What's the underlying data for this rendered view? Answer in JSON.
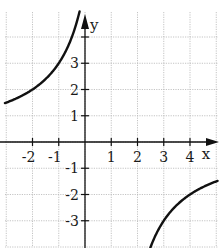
{
  "chart_data": {
    "type": "line",
    "title": "",
    "xlabel": "x",
    "ylabel": "y",
    "function": "y = -6/(x - 1)",
    "vertical_asymptote": 1,
    "horizontal_asymptote": 0,
    "xlim": [
      -3.2,
      5.0
    ],
    "ylim": [
      -3.9,
      5.0
    ],
    "grid": true,
    "x_ticks": [
      -2,
      -1,
      1,
      2,
      3,
      4
    ],
    "y_ticks": [
      -3,
      -2,
      -1,
      1,
      2,
      3
    ],
    "series": [
      {
        "name": "left branch",
        "points": [
          [
            -3,
            1.5
          ],
          [
            -2,
            2
          ],
          [
            -1,
            3
          ],
          [
            -0.5,
            4
          ],
          [
            -0.2,
            5
          ]
        ]
      },
      {
        "name": "right branch",
        "points": [
          [
            2.5,
            -4
          ],
          [
            3,
            -3
          ],
          [
            4,
            -2
          ],
          [
            5,
            -1.5
          ]
        ]
      }
    ],
    "colors": {
      "curve": "#111111",
      "axis": "#111111",
      "grid": "#b5b5b5"
    }
  }
}
